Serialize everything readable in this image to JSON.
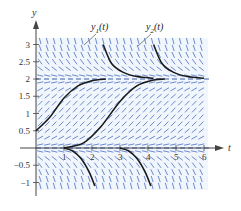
{
  "chart_data": {
    "type": "line",
    "subtype": "slope-field",
    "title": "",
    "xlabel": "t",
    "ylabel": "y",
    "xlim": [
      0,
      6.5
    ],
    "ylim": [
      -1.15,
      3.3
    ],
    "x_ticks": [
      1,
      2,
      3,
      4,
      5,
      6
    ],
    "x_tick_labels": [
      "1",
      "2",
      "3",
      "4",
      "5",
      "6"
    ],
    "y_ticks": [
      -1,
      -0.5,
      0.5,
      1,
      1.5,
      2,
      2.5,
      3
    ],
    "y_tick_labels": [
      "−1",
      "−0.5",
      "0.5",
      "1",
      "1.5",
      "2",
      "2.5",
      "3"
    ],
    "grid": false,
    "equilibria": [
      {
        "y": 0,
        "style": "dashed",
        "color": "#3a5db0"
      },
      {
        "y": 2,
        "style": "dashed",
        "color": "#3a5db0"
      }
    ],
    "slope_field": {
      "color": "#4a6fc0",
      "t_range": [
        0,
        6.1
      ],
      "y_range": [
        -1.1,
        3.1
      ],
      "dt": 0.25,
      "dy": 0.2
    },
    "series": [
      {
        "name": "y1(t)",
        "label": "y₁(t)",
        "branches": [
          {
            "points": [
              [
                0,
                0.5
              ],
              [
                0.5,
                0.9
              ],
              [
                1,
                1.45
              ],
              [
                1.5,
                1.8
              ],
              [
                2,
                1.95
              ],
              [
                2.5,
                2.0
              ]
            ]
          },
          {
            "points": [
              [
                2.4,
                3.0
              ],
              [
                2.7,
                2.45
              ],
              [
                3.1,
                2.2
              ],
              [
                3.6,
                2.07
              ],
              [
                4.2,
                2.02
              ]
            ]
          },
          {
            "points": [
              [
                1.0,
                0.0
              ],
              [
                1.3,
                -0.08
              ],
              [
                1.6,
                -0.3
              ],
              [
                1.9,
                -0.7
              ],
              [
                2.1,
                -1.1
              ]
            ]
          }
        ]
      },
      {
        "name": "y2(t)",
        "label": "y₂(t)",
        "branches": [
          {
            "points": [
              [
                1.0,
                0.0
              ],
              [
                1.7,
                0.15
              ],
              [
                2.3,
                0.6
              ],
              [
                3.0,
                1.35
              ],
              [
                3.6,
                1.8
              ],
              [
                4.2,
                1.97
              ],
              [
                4.6,
                2.0
              ]
            ]
          },
          {
            "points": [
              [
                4.2,
                3.0
              ],
              [
                4.5,
                2.45
              ],
              [
                4.9,
                2.2
              ],
              [
                5.4,
                2.07
              ],
              [
                6.0,
                2.02
              ]
            ]
          },
          {
            "points": [
              [
                3.0,
                0.0
              ],
              [
                3.3,
                -0.08
              ],
              [
                3.6,
                -0.3
              ],
              [
                3.9,
                -0.7
              ],
              [
                4.1,
                -1.1
              ]
            ]
          }
        ]
      }
    ],
    "annotations": [
      {
        "text": "y₁(t)",
        "at": [
          2.5,
          3.5
        ],
        "points_to": [
          2.6,
          2.8
        ]
      },
      {
        "text": "y₂(t)",
        "at": [
          4.4,
          3.5
        ],
        "points_to": [
          4.4,
          2.8
        ]
      }
    ]
  },
  "labels": {
    "x_axis": "t",
    "y_axis": "y",
    "y1": "y",
    "y1_sub": "1",
    "y1_paren": "(t)",
    "y2": "y",
    "y2_sub": "2",
    "y2_paren": "(t)"
  },
  "colors": {
    "field": "#4a6fc0",
    "curve": "#1a1a1a",
    "axis": "#444444",
    "equilibrium": "#3a5db0",
    "background_band": "#eef4fb"
  }
}
